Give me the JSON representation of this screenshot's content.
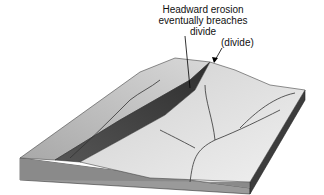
{
  "labels": {
    "headward": [
      "Headward erosion",
      "eventually breaches",
      "divide"
    ],
    "divide": "(divide)"
  },
  "colors": {
    "ridge_light": "#c8c8c8",
    "valley_dark": "#4a4a4a",
    "plain_light": "#e4e4e4",
    "side_face": "#8a8a8a",
    "right_face": "#3c3c3c"
  }
}
